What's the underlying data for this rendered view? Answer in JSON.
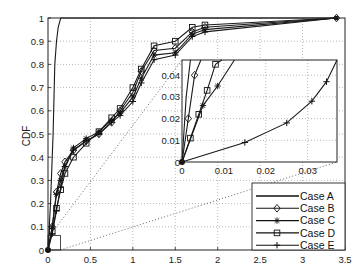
{
  "chart_data": {
    "type": "line",
    "title": "",
    "xlabel": "",
    "ylabel": "CDF",
    "xlim": [
      0,
      3.5
    ],
    "ylim": [
      0,
      1
    ],
    "grid": true,
    "legend_position": "lower right",
    "x_ticks": [
      "0",
      "0.5",
      "1",
      "1.5",
      "2",
      "2.5",
      "3",
      "3.5"
    ],
    "y_ticks": [
      "0",
      "0.1",
      "0.2",
      "0.3",
      "0.4",
      "0.5",
      "0.6",
      "0.7",
      "0.8",
      "0.9",
      "1"
    ],
    "series": [
      {
        "name": "Case A",
        "marker": "none",
        "x": [
          0,
          0.03,
          0.06,
          0.08,
          0.1,
          0.12,
          0.15,
          3.4
        ],
        "y": [
          0,
          0.2,
          0.5,
          0.8,
          0.9,
          0.96,
          1.0,
          1.0
        ]
      },
      {
        "name": "Case B",
        "marker": "diamond",
        "x": [
          0,
          0.05,
          0.1,
          0.15,
          0.2,
          0.3,
          0.45,
          0.6,
          0.75,
          0.85,
          1.0,
          1.1,
          1.25,
          1.5,
          1.7,
          1.85,
          3.4
        ],
        "y": [
          0,
          0.1,
          0.25,
          0.33,
          0.38,
          0.43,
          0.47,
          0.5,
          0.55,
          0.6,
          0.68,
          0.77,
          0.86,
          0.87,
          0.94,
          0.96,
          1.0
        ]
      },
      {
        "name": "Case C",
        "marker": "star",
        "x": [
          0,
          0.05,
          0.1,
          0.15,
          0.2,
          0.3,
          0.45,
          0.6,
          0.75,
          0.85,
          1.0,
          1.1,
          1.25,
          1.5,
          1.7,
          1.85,
          3.4
        ],
        "y": [
          0,
          0.1,
          0.24,
          0.3,
          0.36,
          0.44,
          0.48,
          0.51,
          0.56,
          0.59,
          0.66,
          0.74,
          0.84,
          0.85,
          0.93,
          0.95,
          1.0
        ]
      },
      {
        "name": "Case D",
        "marker": "square",
        "x": [
          0,
          0.05,
          0.1,
          0.15,
          0.2,
          0.3,
          0.45,
          0.6,
          0.75,
          0.85,
          1.0,
          1.1,
          1.25,
          1.5,
          1.7,
          1.85,
          3.4
        ],
        "y": [
          0,
          0.08,
          0.18,
          0.26,
          0.33,
          0.4,
          0.46,
          0.51,
          0.57,
          0.61,
          0.7,
          0.78,
          0.88,
          0.9,
          0.96,
          0.97,
          1.0
        ]
      },
      {
        "name": "Case E",
        "marker": "plus",
        "x": [
          0,
          0.05,
          0.1,
          0.15,
          0.2,
          0.3,
          0.45,
          0.6,
          0.75,
          0.85,
          1.0,
          1.1,
          1.25,
          1.5,
          1.7,
          1.85,
          3.4
        ],
        "y": [
          0,
          0.07,
          0.17,
          0.27,
          0.36,
          0.43,
          0.47,
          0.5,
          0.55,
          0.58,
          0.64,
          0.72,
          0.82,
          0.84,
          0.92,
          0.94,
          1.0
        ]
      }
    ],
    "inset": {
      "xlim": [
        0,
        0.037
      ],
      "ylim": [
        0,
        0.047
      ],
      "x_ticks": [
        "0",
        "0.01",
        "0.02",
        "0.03"
      ],
      "y_ticks": [
        "0",
        "0.01",
        "0.02",
        "0.03",
        "0.04"
      ],
      "zoom_region_main": {
        "x": [
          0,
          0.1
        ],
        "y": [
          0,
          0.05
        ]
      },
      "series": [
        {
          "name": "Case A",
          "x": [
            0,
            0.001,
            0.002
          ],
          "y": [
            0,
            0.03,
            0.047
          ]
        },
        {
          "name": "Case B",
          "x": [
            0,
            0.0015,
            0.003,
            0.0045
          ],
          "y": [
            0,
            0.02,
            0.04,
            0.047
          ]
        },
        {
          "name": "Case C",
          "x": [
            0,
            0.005,
            0.0085,
            0.0125
          ],
          "y": [
            0,
            0.026,
            0.035,
            0.047
          ]
        },
        {
          "name": "Case D",
          "x": [
            0,
            0.002,
            0.004,
            0.006,
            0.008,
            0.0095
          ],
          "y": [
            0,
            0.011,
            0.022,
            0.033,
            0.045,
            0.047
          ]
        },
        {
          "name": "Case E",
          "x": [
            0,
            0.015,
            0.025,
            0.031,
            0.0345,
            0.037
          ],
          "y": [
            0,
            0.009,
            0.018,
            0.028,
            0.037,
            0.047
          ]
        }
      ]
    }
  },
  "labels": {
    "ylabel": "CDF",
    "legend": [
      "Case A",
      "Case B",
      "Case C",
      "Case D",
      "Case E"
    ]
  }
}
